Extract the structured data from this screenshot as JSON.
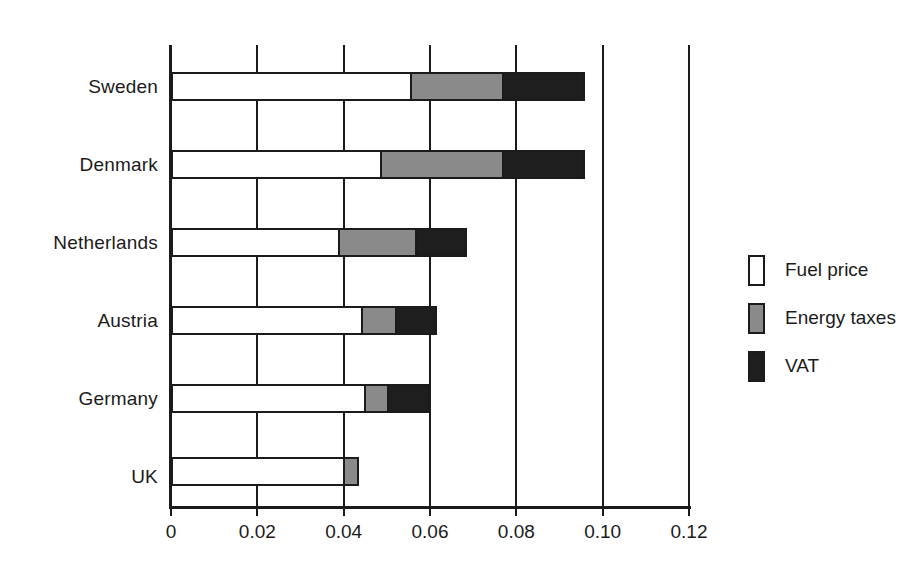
{
  "chart_data": {
    "type": "bar",
    "orientation": "horizontal",
    "stacked": true,
    "title": "",
    "subtitle": "",
    "xlabel": "",
    "ylabel": "",
    "xlim": [
      0,
      0.12
    ],
    "ylim": null,
    "grid": true,
    "grid_axis": "x",
    "legend_position": "right",
    "categories": [
      "Sweden",
      "Denmark",
      "Netherlands",
      "Austria",
      "Germany",
      "UK"
    ],
    "xticks": [
      0,
      0.02,
      0.04,
      0.06,
      0.08,
      0.1,
      0.12
    ],
    "xtick_labels": [
      "0",
      "0.02",
      "0.04",
      "0.06",
      "0.08",
      "0.10",
      "0.12"
    ],
    "series": [
      {
        "name": "Fuel price",
        "color": "#ffffff",
        "values": [
          0.0554,
          0.0484,
          0.0387,
          0.044,
          0.0447,
          0.0399
        ]
      },
      {
        "name": "Energy taxes",
        "color": "#8a8a8a",
        "values": [
          0.0213,
          0.0283,
          0.0178,
          0.0079,
          0.0053,
          0.0032
        ]
      },
      {
        "name": "VAT",
        "color": "#1e1e1e",
        "values": [
          0.0188,
          0.0188,
          0.0116,
          0.0093,
          0.0095,
          0.0
        ]
      }
    ],
    "totals": [
      0.0955,
      0.0955,
      0.0681,
      0.0612,
      0.0595,
      0.0431
    ]
  },
  "legend": {
    "items": [
      {
        "label": "Fuel price",
        "swatch": "fuel"
      },
      {
        "label": "Energy taxes",
        "swatch": "tax"
      },
      {
        "label": "VAT",
        "swatch": "vat"
      }
    ]
  },
  "colors": {
    "fuel_price": "#ffffff",
    "energy_taxes": "#8a8a8a",
    "vat": "#1e1e1e",
    "axis": "#1b1b1b",
    "background": "#ffffff"
  }
}
